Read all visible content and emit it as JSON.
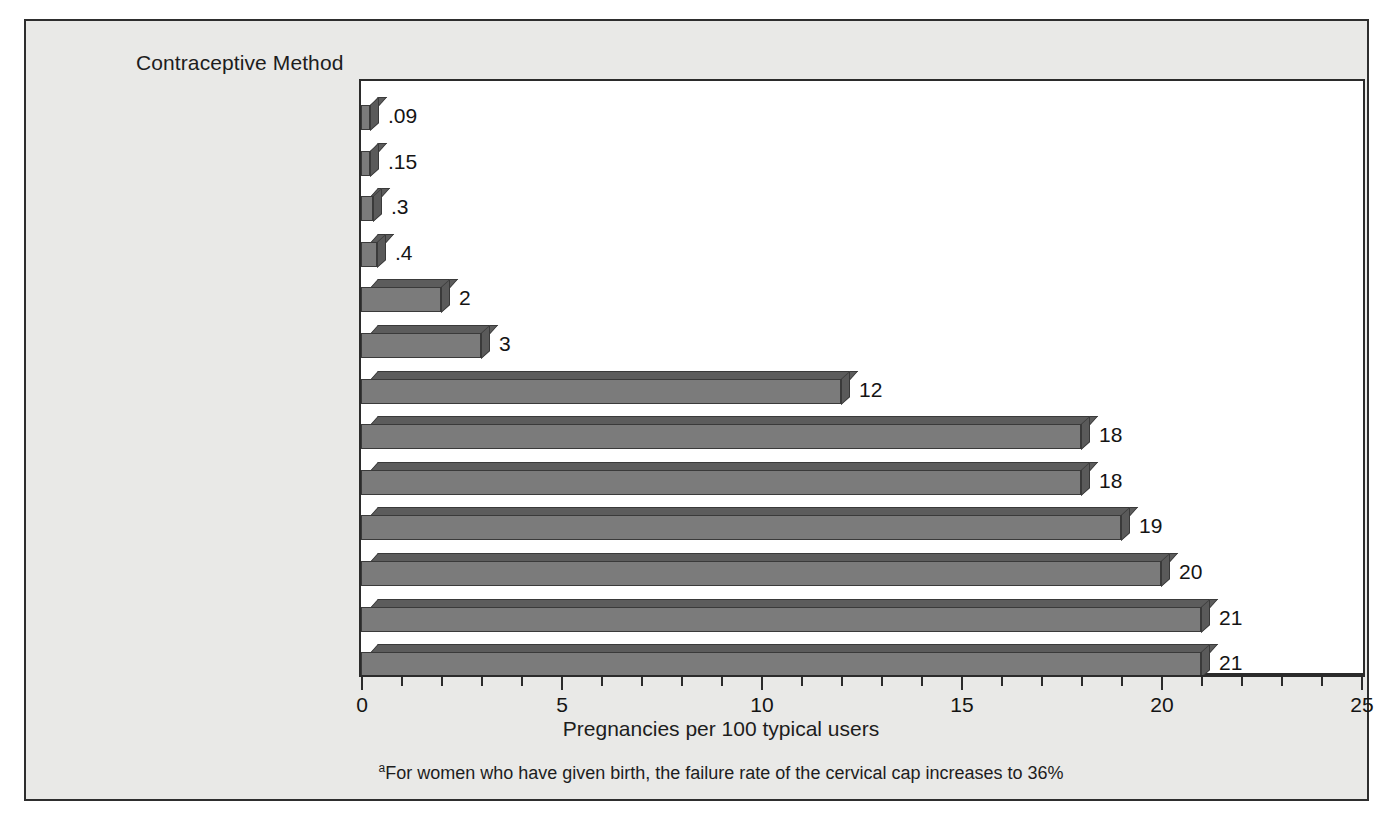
{
  "figure": {
    "background_color": "#ffffff",
    "panel_background_color": "#e9e9e7",
    "plot_background_color": "#ffffff",
    "border_color": "#2e2e2e",
    "bar_front_color": "#7b7b7b",
    "bar_top_color": "#5c5c5c",
    "bar_side_color": "#5a5a5a",
    "text_color": "#1d1d1d"
  },
  "chart_data": {
    "type": "bar",
    "orientation": "horizontal",
    "title": "",
    "ylabel": "Contraceptive Method",
    "xlabel": "Pregnancies per 100 typical users",
    "xlim": [
      0,
      25
    ],
    "xticks": [
      0,
      5,
      10,
      15,
      20,
      25
    ],
    "xtick_labels": [
      "0",
      "5",
      "10",
      "15",
      "20",
      "25"
    ],
    "minor_tick_interval": 1,
    "grid": false,
    "legend": null,
    "categories": [
      "Norplant",
      "Male sterilization",
      "Depo-Provera",
      "Female sterilization",
      "IUD",
      "Oral contraceptives",
      "Male condom",
      "Diaphragm with spermicide",
      "Cervical cap",
      "Withdrawal",
      "Fertility awareness with abstinence",
      "Female condom",
      "Vaginal spermicides used alone"
    ],
    "values": [
      0.09,
      0.15,
      0.3,
      0.4,
      2,
      3,
      12,
      18,
      18,
      19,
      20,
      21,
      21
    ],
    "value_labels": [
      ".09",
      ".15",
      ".3",
      ".4",
      "2",
      "3",
      "12",
      "18",
      "18",
      "19",
      "20",
      "21",
      "21"
    ],
    "bars": [
      {
        "label_line1": "Norplant",
        "label_line2": "",
        "superscript": "",
        "value": 0.09,
        "value_label": ".09"
      },
      {
        "label_line1": "Male sterilization",
        "label_line2": "",
        "superscript": "",
        "value": 0.15,
        "value_label": ".15"
      },
      {
        "label_line1": "Depo-Provera",
        "label_line2": "",
        "superscript": "",
        "value": 0.3,
        "value_label": ".3"
      },
      {
        "label_line1": "Female sterilization",
        "label_line2": "",
        "superscript": "",
        "value": 0.4,
        "value_label": ".4"
      },
      {
        "label_line1": "IUD",
        "label_line2": "",
        "superscript": "",
        "value": 2,
        "value_label": "2"
      },
      {
        "label_line1": "Oral contraceptives",
        "label_line2": "",
        "superscript": "",
        "value": 3,
        "value_label": "3"
      },
      {
        "label_line1": "Male condom",
        "label_line2": "",
        "superscript": "",
        "value": 12,
        "value_label": "12"
      },
      {
        "label_line1": "Diaphragm with spermicide",
        "label_line2": "",
        "superscript": "",
        "value": 18,
        "value_label": "18"
      },
      {
        "label_line1": "Cervical cap",
        "label_line2": "",
        "superscript": "a",
        "value": 18,
        "value_label": "18"
      },
      {
        "label_line1": "Withdrawal",
        "label_line2": "",
        "superscript": "",
        "value": 19,
        "value_label": "19"
      },
      {
        "label_line1": "Fertility awareness",
        "label_line2": "with abstinence",
        "superscript": "",
        "value": 20,
        "value_label": "20"
      },
      {
        "label_line1": "Female condom",
        "label_line2": "",
        "superscript": "",
        "value": 21,
        "value_label": "21"
      },
      {
        "label_line1": "Vaginal spermicides",
        "label_line2": "used alone",
        "superscript": "",
        "value": 21,
        "value_label": "21"
      }
    ]
  },
  "footnote": {
    "marker": "a",
    "text": "For women who have given birth, the failure rate of the cervical cap increases to 36%"
  }
}
